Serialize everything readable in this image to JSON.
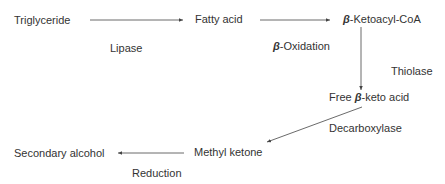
{
  "diagram": {
    "nodes": {
      "triglyceride": "Triglyceride",
      "fatty_acid": "Fatty acid",
      "ketoacyl_beta": "β",
      "ketoacyl_rest": "-Ketoacyl-CoA",
      "free_pre": "Free ",
      "free_beta": "β",
      "free_rest": "-keto acid",
      "methyl_ketone": "Methyl ketone",
      "secondary_alcohol": "Secondary alcohol"
    },
    "enzymes": {
      "lipase": "Lipase",
      "oxidation_beta": "β",
      "oxidation_rest": "-Oxidation",
      "thiolase": "Thiolase",
      "decarboxylase": "Decarboxylase",
      "reduction": "Reduction"
    },
    "colors": {
      "line": "#444444",
      "text": "#333333"
    }
  }
}
